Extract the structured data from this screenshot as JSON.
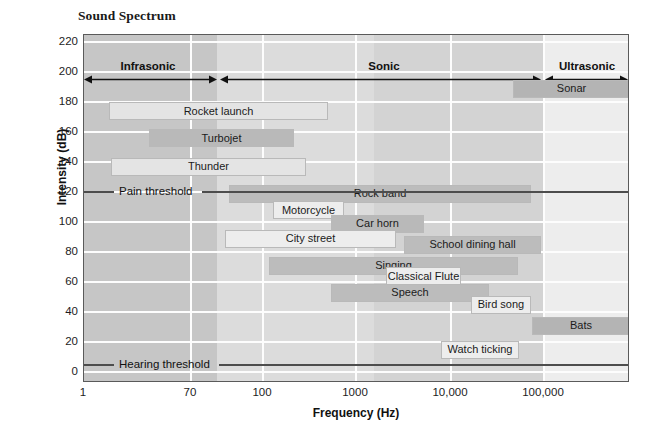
{
  "chart_data": {
    "type": "bar",
    "title": "Sound Spectrum",
    "xlabel": "Frequency (Hz)",
    "ylabel": "Intensity (dB)",
    "xscale": "log",
    "xlim": [
      1,
      300000
    ],
    "ylim": [
      -10,
      228
    ],
    "grid": true,
    "legend_position": "none",
    "x_ticks": [
      {
        "label": "1",
        "value": 1,
        "px": 0
      },
      {
        "label": "70",
        "value": 70,
        "px": 107
      },
      {
        "label": "100",
        "value": 100,
        "px": 179
      },
      {
        "label": "1000",
        "value": 1000,
        "px": 272
      },
      {
        "label": "10,000",
        "value": 10000,
        "px": 367
      },
      {
        "label": "100,000",
        "value": 100000,
        "px": 460
      }
    ],
    "y_ticks": [
      {
        "label": "220",
        "value": 220
      },
      {
        "label": "200",
        "value": 200
      },
      {
        "label": "180",
        "value": 180
      },
      {
        "label": "160",
        "value": 160
      },
      {
        "label": "140",
        "value": 140
      },
      {
        "label": "120",
        "value": 120
      },
      {
        "label": "100",
        "value": 100
      },
      {
        "label": "80",
        "value": 80
      },
      {
        "label": "60",
        "value": 60
      },
      {
        "label": "40",
        "value": 40
      },
      {
        "label": "20",
        "value": 20
      },
      {
        "label": "0",
        "value": 0
      }
    ],
    "regions": [
      {
        "label": "Infrasonic",
        "start_px": 0,
        "end_px": 133,
        "center_px": 64
      },
      {
        "label": "Sonic",
        "start_px": 136,
        "end_px": 457,
        "center_px": 300
      },
      {
        "label": "Ultrasonic",
        "start_px": 461,
        "end_px": 544,
        "center_px": 503
      }
    ],
    "background_bands": [
      {
        "start_px": 0,
        "end_px": 133,
        "color": "#c6c6c6"
      },
      {
        "start_px": 133,
        "end_px": 290,
        "color": "#dcdcdc"
      },
      {
        "start_px": 290,
        "end_px": 459,
        "color": "#d3d3d3"
      },
      {
        "start_px": 459,
        "end_px": 546,
        "color": "#ededed"
      }
    ],
    "thresholds": [
      {
        "label": "Pain threshold",
        "value": 120,
        "y_px": 151,
        "label_x_px": 18,
        "line_start_px": 0,
        "line_end_px": 546
      },
      {
        "label": "Hearing threshold",
        "value": 5,
        "y_px": 324,
        "label_x_px": 18,
        "line_start_px": 0,
        "line_end_px": 546
      }
    ],
    "bars": [
      {
        "label": "Rocket launch",
        "x_start_px": 25,
        "x_end_px": 244,
        "db_low": 168,
        "db_high": 180,
        "color": "#e4e4e4"
      },
      {
        "label": "Sonar",
        "x_start_px": 429,
        "x_end_px": 546,
        "db_low": 183,
        "db_high": 195,
        "color": "#b4b4b4"
      },
      {
        "label": "Turbojet",
        "x_start_px": 65,
        "x_end_px": 210,
        "db_low": 150,
        "db_high": 162,
        "color": "#b9b9b9"
      },
      {
        "label": "Thunder",
        "x_start_px": 27,
        "x_end_px": 222,
        "db_low": 131,
        "db_high": 143,
        "color": "#e4e4e4"
      },
      {
        "label": "Rock band",
        "x_start_px": 145,
        "x_end_px": 447,
        "db_low": 113,
        "db_high": 125,
        "color": "#bcbcbc"
      },
      {
        "label": "Motorcycle",
        "x_start_px": 189,
        "x_end_px": 260,
        "db_low": 102,
        "db_high": 114,
        "color": "#ededed"
      },
      {
        "label": "Car horn",
        "x_start_px": 247,
        "x_end_px": 340,
        "db_low": 93,
        "db_high": 105,
        "color": "#b9b9b9"
      },
      {
        "label": "City street",
        "x_start_px": 141,
        "x_end_px": 312,
        "db_low": 83,
        "db_high": 95,
        "color": "#ededed"
      },
      {
        "label": "School dining hall",
        "x_start_px": 320,
        "x_end_px": 457,
        "db_low": 79,
        "db_high": 91,
        "color": "#bcbcbc"
      },
      {
        "label": "Singing",
        "x_start_px": 185,
        "x_end_px": 434,
        "db_low": 65,
        "db_high": 77,
        "color": "#bcbcbc"
      },
      {
        "label": "Classical Flute",
        "x_start_px": 302,
        "x_end_px": 377,
        "db_low": 58,
        "db_high": 70,
        "color": "#ededed"
      },
      {
        "label": "Speech",
        "x_start_px": 247,
        "x_end_px": 405,
        "db_low": 47,
        "db_high": 59,
        "color": "#bcbcbc"
      },
      {
        "label": "Bird song",
        "x_start_px": 387,
        "x_end_px": 447,
        "db_low": 39,
        "db_high": 51,
        "color": "#ededed"
      },
      {
        "label": "Bats",
        "x_start_px": 448,
        "x_end_px": 546,
        "db_low": 25,
        "db_high": 37,
        "color": "#b4b4b4"
      },
      {
        "label": "Watch ticking",
        "x_start_px": 357,
        "x_end_px": 435,
        "db_low": 9,
        "db_high": 21,
        "color": "#ededed"
      }
    ]
  },
  "colors": {
    "plot_border": "#5a5a5a",
    "gridline": "#fdfdfd",
    "threshold": "#4d4d4d",
    "text": "#1a1a1a"
  }
}
